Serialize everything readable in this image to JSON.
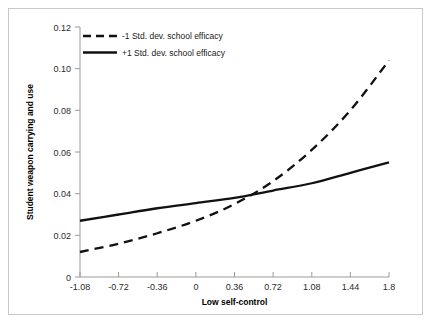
{
  "chart_data": {
    "type": "line",
    "title": "",
    "xlabel": "Low self-control",
    "ylabel": "Student weapon carrying and use",
    "xlim": [
      -1.08,
      1.8
    ],
    "ylim": [
      0,
      0.12
    ],
    "grid": false,
    "legend_position": "top-left inside plot",
    "xticks": [
      "-1.08",
      "-0.72",
      "-0.36",
      "0",
      "0.36",
      "0.72",
      "1.08",
      "1.44",
      "1.8"
    ],
    "xtick_values": [
      -1.08,
      -0.72,
      -0.36,
      0,
      0.36,
      0.72,
      1.08,
      1.44,
      1.8
    ],
    "yticks": [
      "0",
      "0.02",
      "0.04",
      "0.06",
      "0.08",
      "0.10",
      "0.12"
    ],
    "ytick_values": [
      0,
      0.02,
      0.04,
      0.06,
      0.08,
      0.1,
      0.12
    ],
    "x": [
      -1.08,
      -0.72,
      -0.36,
      0,
      0.36,
      0.72,
      1.08,
      1.44,
      1.8
    ],
    "series": [
      {
        "name": "-1 Std. dev. school efficacy",
        "style": "dashed",
        "color": "#111111",
        "values": [
          0.012,
          0.016,
          0.021,
          0.027,
          0.035,
          0.046,
          0.061,
          0.08,
          0.104
        ]
      },
      {
        "name": "+1 Std. dev. school efficacy",
        "style": "solid",
        "color": "#111111",
        "values": [
          0.027,
          0.03,
          0.033,
          0.0355,
          0.038,
          0.0415,
          0.045,
          0.05,
          0.055
        ]
      }
    ]
  },
  "legend": {
    "items": [
      {
        "label": "-1 Std. dev. school efficacy",
        "style": "dashed"
      },
      {
        "label": "+1 Std. dev. school efficacy",
        "style": "solid"
      }
    ]
  },
  "axes": {
    "x_title": "Low self-control",
    "y_title": "Student weapon carrying and use"
  }
}
